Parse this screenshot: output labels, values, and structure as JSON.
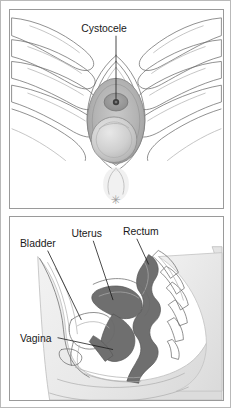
{
  "figure": {
    "panels": [
      {
        "id": "external-view",
        "name": "external-genital-view",
        "labels": [
          {
            "id": "cystocele",
            "text": "Cystocele"
          }
        ],
        "markers": [
          {
            "id": "asterisk",
            "text": "✳"
          }
        ]
      },
      {
        "id": "sagittal-view",
        "name": "pelvic-sagittal-cross-section",
        "labels": [
          {
            "id": "bladder",
            "text": "Bladder"
          },
          {
            "id": "uterus",
            "text": "Uterus"
          },
          {
            "id": "rectum",
            "text": "Rectum"
          },
          {
            "id": "vagina",
            "text": "Vagina"
          }
        ]
      }
    ]
  },
  "colors": {
    "page_background": "#ffffff",
    "outer_border": "#b9b9b9",
    "panel_border": "#9a9a9a",
    "line_art": "#6b6b6b",
    "label_text": "#1a1a1a",
    "organ_dark": "#6f6f6f",
    "organ_mid": "#9b9b9b",
    "organ_light": "#d4d4d4",
    "body_fill": "#ececec",
    "marker": "#9c9c9c"
  }
}
